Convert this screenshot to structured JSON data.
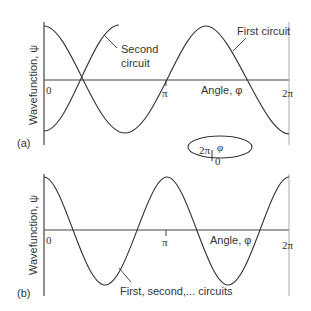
{
  "panel_a": {
    "label": "(a)",
    "ylabel": "Wavefunction, ψ",
    "xlabel": "Angle, φ",
    "ticks": {
      "zero": "0",
      "pi": "π",
      "two_pi": "2π"
    },
    "annotations": {
      "second_line1": "Second",
      "second_line2": "circuit",
      "first": "First circuit"
    }
  },
  "ring": {
    "two_pi": "2π",
    "phi": "φ",
    "zero": "0"
  },
  "panel_b": {
    "label": "(b)",
    "ylabel": "Wavefunction, ψ",
    "xlabel": "Angle, φ",
    "ticks": {
      "zero": "0",
      "pi": "π",
      "two_pi": "2π"
    },
    "annotation": "First, second,... circuits"
  },
  "colors": {
    "line": "#333333",
    "axis": "#444444",
    "gray_axis": "#999999"
  }
}
